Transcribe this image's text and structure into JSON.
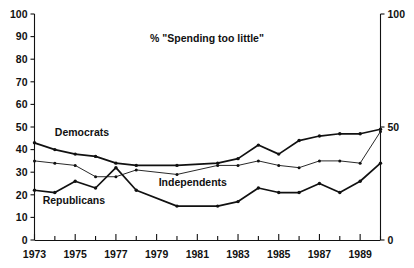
{
  "chart_data": {
    "type": "line",
    "title": "% \"Spending too little\"",
    "xlabel": "",
    "ylabel": "",
    "ylim": [
      0,
      100
    ],
    "xlim": [
      1973,
      1990
    ],
    "grid": false,
    "legend_position": "inline-labels",
    "y_ticks_left": [
      0,
      10,
      20,
      30,
      40,
      50,
      60,
      70,
      80,
      90,
      100
    ],
    "y_ticks_right": [
      0,
      50,
      100
    ],
    "x_ticks_major": [
      1973,
      1975,
      1977,
      1979,
      1981,
      1983,
      1985,
      1987,
      1989
    ],
    "x_ticks_minor": [
      1974,
      1976,
      1978,
      1980,
      1982,
      1984,
      1986,
      1988,
      1990
    ],
    "x": [
      1973,
      1974,
      1975,
      1976,
      1977,
      1978,
      1980,
      1982,
      1983,
      1984,
      1985,
      1986,
      1987,
      1988,
      1989,
      1990
    ],
    "series": [
      {
        "name": "Democrats",
        "style": "thick",
        "label_x": 1974.0,
        "label_y": 46,
        "values": [
          43,
          40,
          38,
          37,
          34,
          33,
          33,
          34,
          36,
          42,
          38,
          44,
          46,
          47,
          47,
          49
        ]
      },
      {
        "name": "Independents",
        "style": "thin",
        "label_x": 1979.1,
        "label_y": 24,
        "values": [
          35,
          34,
          33,
          28,
          28,
          31,
          29,
          33,
          33,
          35,
          33,
          32,
          35,
          35,
          34,
          48
        ]
      },
      {
        "name": "Republicans",
        "style": "thick",
        "label_x": 1973.4,
        "label_y": 16,
        "values": [
          22,
          21,
          26,
          23,
          32,
          22,
          15,
          15,
          17,
          23,
          21,
          21,
          25,
          21,
          26,
          34
        ]
      }
    ]
  }
}
